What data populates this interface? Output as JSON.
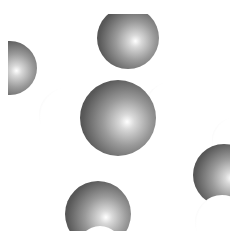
{
  "scene": {
    "description": "3D space-filling molecular model render",
    "background": "#ffffff",
    "colors": {
      "carbon": "#5a5a5a",
      "hydrogen": "#ffffff"
    },
    "atoms": [
      {
        "id": "h-top",
        "element": "H",
        "cx": 122,
        "cy": -4,
        "r": 20
      },
      {
        "id": "h-left-top",
        "element": "H",
        "cx": 10,
        "cy": 14,
        "r": 18
      },
      {
        "id": "c-top",
        "element": "C",
        "cx": 120,
        "cy": 24,
        "r": 31
      },
      {
        "id": "c-left",
        "element": "C",
        "cx": 2,
        "cy": 54,
        "r": 27
      },
      {
        "id": "h-center-left",
        "element": "H",
        "cx": 58,
        "cy": 101,
        "r": 27
      },
      {
        "id": "h-center-right",
        "element": "H",
        "cx": 162,
        "cy": 93,
        "r": 25
      },
      {
        "id": "c-center",
        "element": "C",
        "cx": 110,
        "cy": 104,
        "r": 38
      },
      {
        "id": "h-right-top",
        "element": "H",
        "cx": 226,
        "cy": 126,
        "r": 22
      },
      {
        "id": "c-right",
        "element": "C",
        "cx": 216,
        "cy": 161,
        "r": 31
      },
      {
        "id": "h-right-bottom",
        "element": "H",
        "cx": 214,
        "cy": 208,
        "r": 27
      },
      {
        "id": "c-bottom",
        "element": "C",
        "cx": 90,
        "cy": 200,
        "r": 33
      },
      {
        "id": "h-bottom",
        "element": "H",
        "cx": 92,
        "cy": 234,
        "r": 22
      }
    ]
  }
}
